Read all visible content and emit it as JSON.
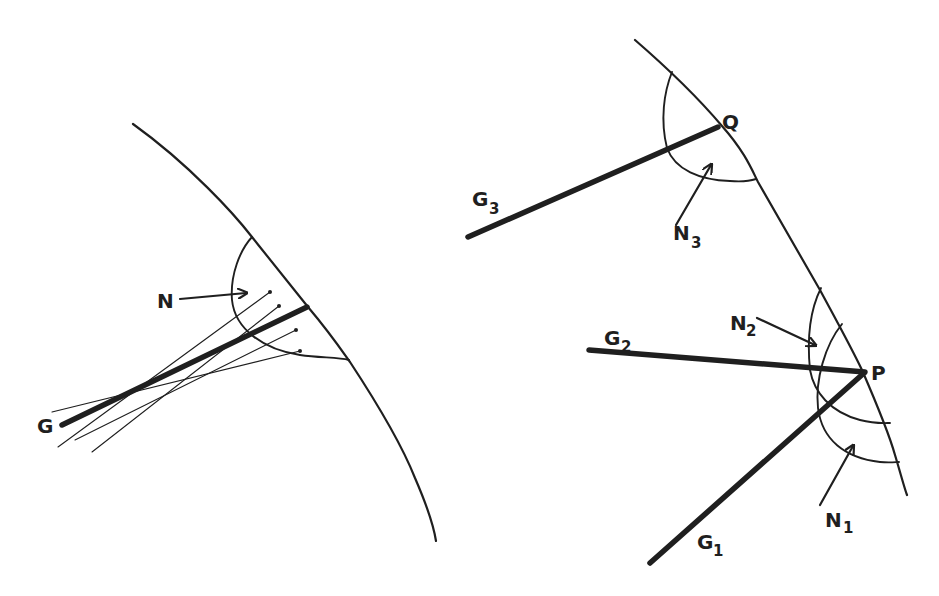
{
  "figure": {
    "type": "diagram",
    "left_panel": {
      "labels": {
        "ray": "G",
        "normal_arrow": "N"
      },
      "thin_ray_count": 4
    },
    "right_panel": {
      "labels": {
        "point_upper": "Q",
        "point_lower": "P",
        "ray_1": "G",
        "ray_1_sub": "1",
        "ray_2": "G",
        "ray_2_sub": "2",
        "ray_3": "G",
        "ray_3_sub": "3",
        "normal_1": "N",
        "normal_1_sub": "1",
        "normal_2": "N",
        "normal_2_sub": "2",
        "normal_3": "N",
        "normal_3_sub": "3"
      }
    }
  },
  "colors": {
    "ink": "#1f1f1f",
    "background": "#ffffff"
  }
}
